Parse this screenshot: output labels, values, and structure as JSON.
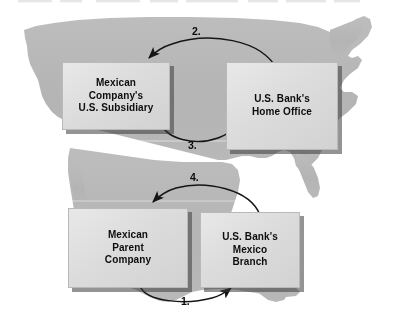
{
  "diagram": {
    "background_map": "north-america-silhouette",
    "map_color": "#b6b6b6",
    "box_fill": "#dcdcdc",
    "box_shadow": "#3c3c3c",
    "arrow_color": "#1a1a1a",
    "text_color": "#0d0d0d"
  },
  "boxes": [
    {
      "id": "mexican-us-subsidiary",
      "label": "Mexican Company's\nU.S. Subsidiary",
      "region": "united-states"
    },
    {
      "id": "us-bank-home-office",
      "label": "U.S. Bank's\nHome Office",
      "region": "united-states"
    },
    {
      "id": "mexican-parent-company",
      "label": "Mexican\nParent\nCompany",
      "region": "mexico"
    },
    {
      "id": "us-bank-mexico-branch",
      "label": "U.S. Bank's\nMexico\nBranch",
      "region": "mexico"
    }
  ],
  "steps": [
    {
      "number": "1.",
      "from": "mexican-parent-company",
      "to": "us-bank-mexico-branch",
      "direction": "left-to-right",
      "position": "below-lower-boxes"
    },
    {
      "number": "2.",
      "from": "us-bank-home-office",
      "to": "mexican-us-subsidiary",
      "direction": "right-to-left",
      "position": "above-upper-boxes"
    },
    {
      "number": "3.",
      "from": "mexican-us-subsidiary",
      "to": "us-bank-home-office",
      "direction": "left-to-right",
      "position": "between-upper-boxes"
    },
    {
      "number": "4.",
      "from": "us-bank-mexico-branch",
      "to": "mexican-parent-company",
      "direction": "right-to-left",
      "position": "above-lower-boxes"
    }
  ]
}
